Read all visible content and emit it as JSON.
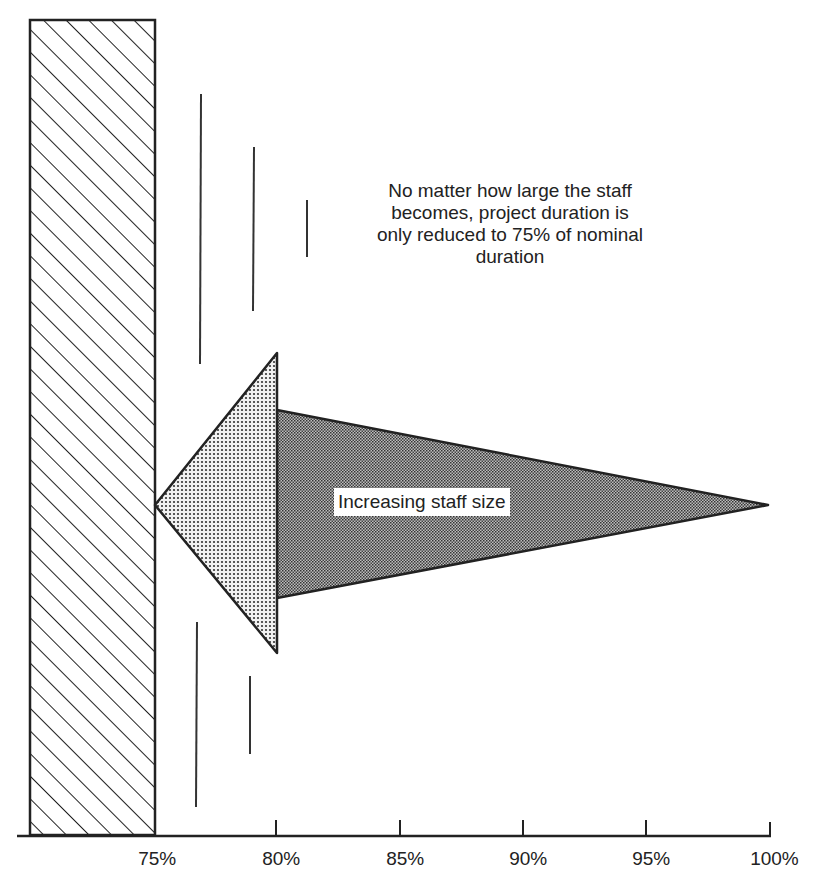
{
  "diagram": {
    "callout_lines": [
      "No matter how large the staff",
      "becomes, project duration is",
      "only reduced to 75% of nominal",
      "duration"
    ],
    "arrow_label": "Increasing staff size",
    "barrier_label": "",
    "axis": {
      "ticks": [
        "75%",
        "80%",
        "85%",
        "90%",
        "95%",
        "100%"
      ],
      "tick_x": [
        152,
        276,
        400,
        523,
        646,
        770
      ]
    },
    "colors": {
      "ink": "#222222",
      "background": "#ffffff",
      "arrow_body_fill": "#9a9a9a",
      "arrow_head_fill": "#c8c8c8"
    }
  }
}
